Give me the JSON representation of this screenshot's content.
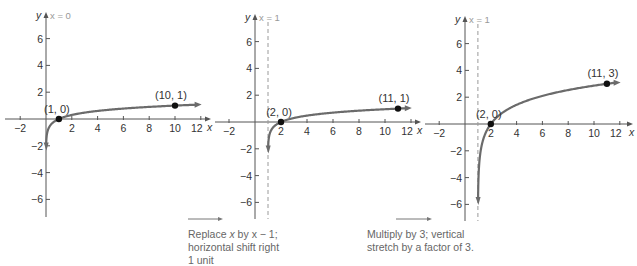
{
  "chart_data": [
    {
      "type": "line",
      "title": "",
      "xlabel": "x",
      "ylabel": "y",
      "asymptote_label": "x = 0",
      "asymptote_x": 0,
      "asymptote_dashed": false,
      "function": "y = log10(x)",
      "xlim": [
        -3,
        12.5
      ],
      "ylim": [
        -7,
        7
      ],
      "x_ticks": [
        -2,
        2,
        4,
        6,
        8,
        10,
        12
      ],
      "y_ticks": [
        6,
        4,
        2,
        -2,
        -4,
        -6
      ],
      "points": [
        {
          "label": "(1, 0)",
          "x": 1,
          "y": 0
        },
        {
          "label": "(10, 1)",
          "x": 10,
          "y": 1
        }
      ],
      "grid": false
    },
    {
      "type": "line",
      "title": "",
      "xlabel": "x",
      "ylabel": "y",
      "asymptote_label": "x = 1",
      "asymptote_x": 1,
      "asymptote_dashed": true,
      "function": "y = log10(x - 1)",
      "xlim": [
        -3,
        12.5
      ],
      "ylim": [
        -7,
        7
      ],
      "x_ticks": [
        -2,
        2,
        4,
        6,
        8,
        10,
        12
      ],
      "y_ticks": [
        6,
        4,
        2,
        -2,
        -4,
        -6
      ],
      "points": [
        {
          "label": "(2, 0)",
          "x": 2,
          "y": 0
        },
        {
          "label": "(11, 1)",
          "x": 11,
          "y": 1
        }
      ],
      "grid": false
    },
    {
      "type": "line",
      "title": "",
      "xlabel": "x",
      "ylabel": "y",
      "asymptote_label": "x = 1",
      "asymptote_x": 1,
      "asymptote_dashed": true,
      "function": "y = 3 log10(x - 1)",
      "xlim": [
        -3,
        12.5
      ],
      "ylim": [
        -7,
        7
      ],
      "x_ticks": [
        -2,
        2,
        4,
        6,
        8,
        10,
        12
      ],
      "y_ticks": [
        6,
        4,
        2,
        -2,
        -4,
        -6
      ],
      "points": [
        {
          "label": "(2, 0)",
          "x": 2,
          "y": 0
        },
        {
          "label": "(11, 3)",
          "x": 11,
          "y": 3
        }
      ],
      "grid": false
    }
  ],
  "graphs": [
    {
      "origin_x": 46,
      "origin_y": 119,
      "sx": 12.9,
      "sy": 13.4,
      "top": 12,
      "bottom": 217,
      "left": 5,
      "right": 210
    },
    {
      "origin_x": 255,
      "origin_y": 122,
      "sx": 13.0,
      "sy": 13.4,
      "top": 14,
      "bottom": 219,
      "left": 215,
      "right": 420
    },
    {
      "origin_x": 465,
      "origin_y": 124,
      "sx": 12.9,
      "sy": 13.4,
      "top": 16,
      "bottom": 221,
      "left": 425,
      "right": 632
    }
  ],
  "captions": [
    {
      "line1_pre": "Replace ",
      "line1_var": "x",
      "line1_post": " by x − 1;",
      "line2": "horizontal shift right",
      "line3": "1 unit"
    },
    {
      "line1": "Multiply by 3; vertical",
      "line2": "stretch by a factor of 3."
    }
  ],
  "colors": {
    "curve": "#6b6b6b",
    "axis": "#555555",
    "dashed": "#9a9a9a",
    "point": "#111111",
    "text": "#333333"
  }
}
